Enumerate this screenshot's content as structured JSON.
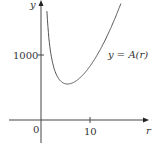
{
  "chart_data": {
    "type": "line",
    "title": "",
    "xlabel": "r",
    "ylabel": "y",
    "series": [
      {
        "name": "y = A(r)",
        "formula": "A(r) = 2*pi*r^2 + 2000/r",
        "x": [
          1.5,
          2,
          3,
          4,
          5,
          5.42,
          6,
          7,
          8,
          10,
          12,
          14,
          16.5
        ],
        "values": [
          1348,
          1025,
          723,
          601,
          557,
          554,
          559,
          594,
          652,
          828,
          1071,
          1374,
          1832
        ]
      }
    ],
    "xticks": [
      "0",
      "10"
    ],
    "yticks": [
      "1000"
    ],
    "xlim": [
      -8,
      24
    ],
    "ylim": [
      -550,
      1850
    ],
    "grid": false,
    "legend": "none",
    "annotations": [
      {
        "text": "y = A(r)",
        "x": 17,
        "y": 1000
      }
    ]
  },
  "labels": {
    "y_axis": "y",
    "x_axis": "r",
    "origin": "0",
    "x_tick": "10",
    "y_tick": "1000",
    "curve": "y = A(r)"
  },
  "colors": {
    "axis": "#444444",
    "curve": "#555555",
    "text": "#333333"
  }
}
